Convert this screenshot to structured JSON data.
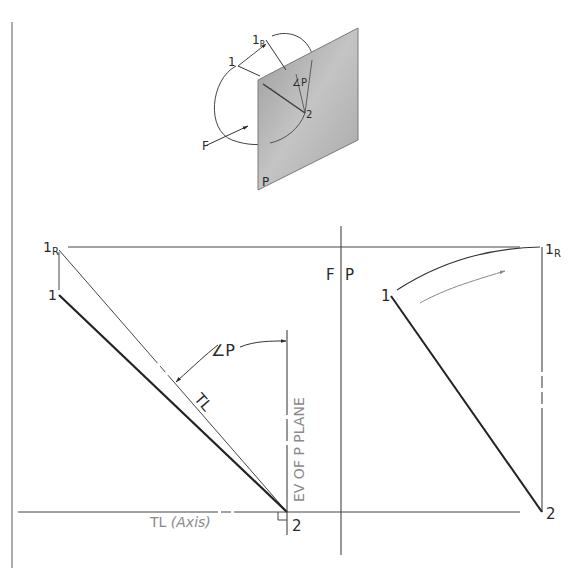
{
  "pictorial": {
    "labels": {
      "point1": "1",
      "point1R": "1",
      "point1R_sub": "R",
      "point2": "2",
      "angle": "∠P",
      "frontal": "F",
      "plane": "P"
    }
  },
  "front_view": {
    "labels": {
      "point1R": "1",
      "point1R_sub": "R",
      "point1": "1",
      "point2": "2",
      "angle": "∠P",
      "true_length": "TL",
      "edge_view": "EV OF P PLANE",
      "axis_tl": "TL",
      "axis_note": "(Axis)"
    }
  },
  "fold_line": {
    "label_left": "F",
    "label_right": "P"
  },
  "profile_view": {
    "labels": {
      "point1": "1",
      "point1R": "1",
      "point1R_sub": "R",
      "point2": "2"
    }
  },
  "colors": {
    "line": "#2a2a2a",
    "thin": "#555555",
    "gray_text": "#8a8a8a",
    "plane_fill": "#b8b8b8",
    "plane_dark": "#8f8f8f"
  }
}
